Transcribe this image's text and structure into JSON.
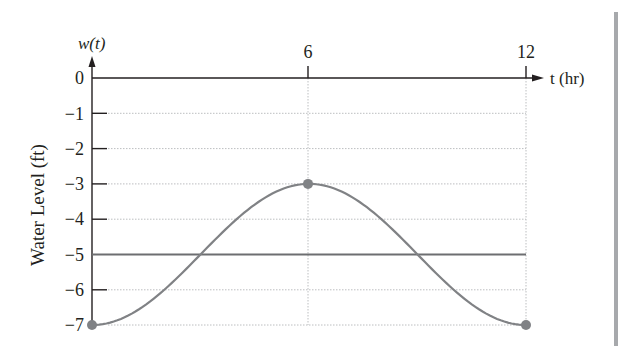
{
  "chart_data": {
    "type": "line",
    "title": "",
    "xlabel": "t (hr)",
    "ylabel": "Water Level (ft)",
    "y_axis_function_label": "w(t)",
    "x_ticks": [
      6,
      12
    ],
    "x_tick_labels": [
      "6",
      "12"
    ],
    "y_ticks": [
      0,
      -1,
      -2,
      -3,
      -4,
      -5,
      -6,
      -7
    ],
    "y_tick_labels": [
      "0",
      "−1",
      "−2",
      "−3",
      "−4",
      "−5",
      "−6",
      "−7"
    ],
    "xlim": [
      0,
      12
    ],
    "ylim": [
      -7,
      0
    ],
    "grid": true,
    "legend": null,
    "series": [
      {
        "name": "w(t)",
        "kind": "sinusoid",
        "x": [
          0,
          1,
          2,
          3,
          4,
          5,
          6,
          7,
          8,
          9,
          10,
          11,
          12
        ],
        "values": [
          -7,
          -6.73,
          -6,
          -5,
          -4,
          -3.27,
          -3,
          -3.27,
          -4,
          -5,
          -6,
          -6.73,
          -7
        ],
        "marked_points": [
          {
            "t": 0,
            "w": -7
          },
          {
            "t": 6,
            "w": -3
          },
          {
            "t": 12,
            "w": -7
          }
        ],
        "color": "#808285"
      },
      {
        "name": "midline",
        "kind": "horizontal",
        "x": [
          0,
          12
        ],
        "values": [
          -5,
          -5
        ],
        "color": "#6d6e71"
      }
    ]
  },
  "labels": {
    "y_function": "w(t)",
    "x_axis": "t (hr)",
    "y_axis": "Water Level (ft)",
    "tick_x_6": "6",
    "tick_x_12": "12",
    "tick_y_0": "0",
    "tick_y_1": "−1",
    "tick_y_2": "−2",
    "tick_y_3": "−3",
    "tick_y_4": "−4",
    "tick_y_5": "−5",
    "tick_y_6": "−6",
    "tick_y_7": "−7"
  },
  "colors": {
    "axis": "#231f20",
    "curve": "#808285",
    "midline": "#6d6e71",
    "grid": "#bcbec0",
    "page_edge": "#a7a9ac"
  }
}
